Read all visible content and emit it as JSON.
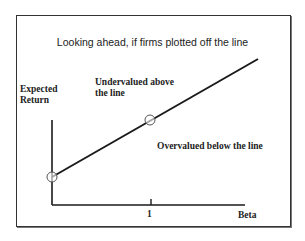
{
  "title": "Looking ahead, if firms plotted off the line",
  "axes": {
    "y_label_line1": "Expected",
    "y_label_line2": "Return",
    "x_label": "Beta",
    "x_tick": "1"
  },
  "regions": {
    "above_line1": "Undervalued above",
    "above_line2": "the line",
    "below": "Overvalued below the line"
  },
  "colors": {
    "line": "#1a1a1a",
    "text": "#222222"
  }
}
